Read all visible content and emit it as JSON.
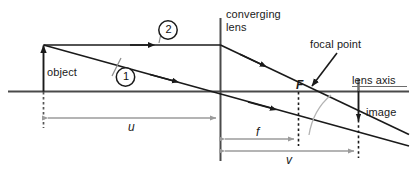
{
  "diagram": {
    "labels": {
      "object": "object",
      "converging_lens_line1": "converging",
      "converging_lens_line2": "lens",
      "focal_point": "focal point",
      "focal_point_symbol": "F",
      "lens_axis": "lens axis",
      "image": "image"
    },
    "dimensions": [
      {
        "symbol": "u",
        "name": "object-distance",
        "from_px": 43,
        "to_px": 220,
        "y_px": 118
      },
      {
        "symbol": "f",
        "name": "focal-length",
        "from_px": 220,
        "to_px": 298,
        "y_px": 139
      },
      {
        "symbol": "v",
        "name": "image-distance",
        "from_px": 220,
        "to_px": 358,
        "y_px": 151
      }
    ],
    "rays": [
      {
        "id": "1",
        "name": "ray-through-centre",
        "label": "1"
      },
      {
        "id": "2",
        "name": "ray-parallel-to-axis",
        "label": "2"
      }
    ],
    "colors": {
      "stroke": "#1a1a1a",
      "dimension": "#9b9b9b",
      "arc": "#b4b4b4",
      "background": "#ffffff"
    }
  }
}
